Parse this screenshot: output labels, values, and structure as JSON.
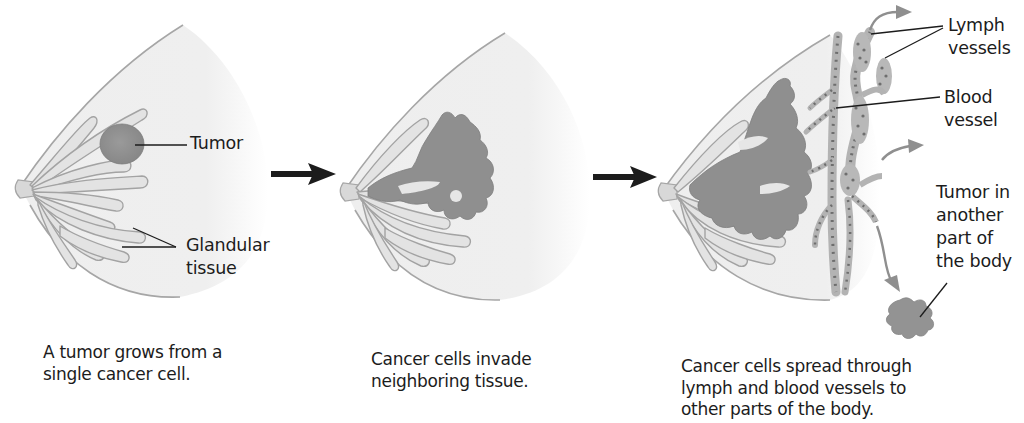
{
  "colors": {
    "background": "#ffffff",
    "breast_fill": "#ececec",
    "outline": "#a6a6a6",
    "gland_fill": "#e6e6e6",
    "tumor": "#8c8c8c",
    "vessel": "#b3b3b3",
    "vessel_dots": "#6e6e6e",
    "step_arrow": "#1c1c1c",
    "spread_arrow": "#8f8f8f",
    "text": "#1c1c1c"
  },
  "panels": [
    {
      "id": "stage-1",
      "labels": [
        {
          "text": "Tumor"
        },
        {
          "text": "Glandular"
        },
        {
          "text": "tissue"
        }
      ],
      "caption": [
        "A tumor grows from a",
        "single cancer cell."
      ]
    },
    {
      "id": "stage-2",
      "labels": [],
      "caption": [
        "Cancer cells invade",
        "neighboring tissue."
      ]
    },
    {
      "id": "stage-3",
      "labels": [
        {
          "text": "Lymph"
        },
        {
          "text": "vessels"
        },
        {
          "text": "Blood"
        },
        {
          "text": "vessel"
        },
        {
          "text": "Tumor in"
        },
        {
          "text": "another"
        },
        {
          "text": "part of"
        },
        {
          "text": "the body"
        }
      ],
      "caption": [
        "Cancer cells spread through",
        "lymph and blood vessels to",
        "other parts of the body."
      ]
    }
  ],
  "icons": {
    "step_arrow_1": "right-arrow-icon",
    "step_arrow_2": "right-arrow-icon"
  }
}
